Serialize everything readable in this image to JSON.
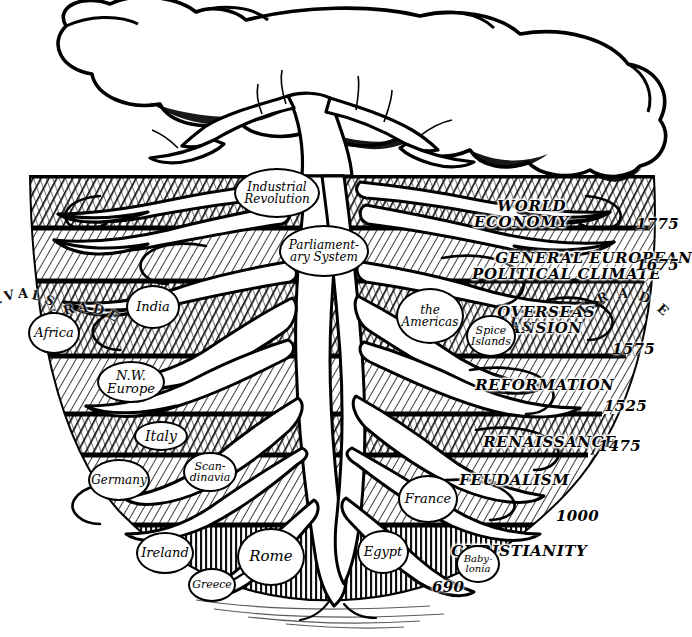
{
  "figure": {
    "medium": "pen-and-ink cross-hatched illustration",
    "caption_fragment": "",
    "ink_color": "#000000",
    "paper_color": "#ffffff"
  },
  "canopy": {
    "name": "tree-crown",
    "description": "outlined white lobed canopy with branching limbs"
  },
  "trunk": {
    "name": "tree-trunk",
    "description": "white trunk descending from canopy into soil strata"
  },
  "strata": [
    {
      "id": "world-economy",
      "label": "WORLD\nECONOMY",
      "label_plain": "WORLD ECONOMY",
      "end_date": "1775",
      "shade": "dark",
      "top": 176,
      "bottom": 228
    },
    {
      "id": "general-european-political-climate",
      "label": "GENERAL EUROPEAN\nPOLITICAL CLIMATE",
      "label_plain": "GENERAL EUROPEAN POLITICAL CLIMATE",
      "end_date": "1675",
      "shade": "light",
      "top": 228,
      "bottom": 281
    },
    {
      "id": "overseas-expansion",
      "label": "OVERSEAS\nEXPANSION",
      "label_plain": "OVERSEAS EXPANSION",
      "end_date": "1575",
      "shade": "dark",
      "top": 281,
      "bottom": 356
    },
    {
      "id": "reformation",
      "label": "REFORMATION",
      "label_plain": "REFORMATION",
      "end_date": "1525",
      "shade": "light",
      "top": 356,
      "bottom": 414
    },
    {
      "id": "renaissance",
      "label": "RENAISSANCE",
      "label_plain": "RENAISSANCE",
      "end_date": "1475",
      "shade": "dark",
      "top": 414,
      "bottom": 455
    },
    {
      "id": "feudalism",
      "label": "FEUDALISM",
      "label_plain": "FEUDALISM",
      "end_date": "1000",
      "shade": "light",
      "top": 455,
      "bottom": 525
    },
    {
      "id": "christianity",
      "label": "CHRISTIANITY",
      "label_plain": "CHRISTIANITY",
      "end_date": "690",
      "shade": "dark",
      "top": 525,
      "bottom": 600
    }
  ],
  "dates": [
    {
      "value": "1775",
      "x": 636,
      "y": 224
    },
    {
      "value": "1675",
      "x": 636,
      "y": 264
    },
    {
      "value": "1575",
      "x": 612,
      "y": 348
    },
    {
      "value": "1525",
      "x": 604,
      "y": 405
    },
    {
      "value": "1475",
      "x": 598,
      "y": 445
    },
    {
      "value": "1000",
      "x": 556,
      "y": 515
    },
    {
      "value": "690",
      "x": 432,
      "y": 586
    }
  ],
  "root_nodes": [
    {
      "id": "industrial-revolution",
      "label": "Industrial\nRevolution",
      "label_plain": "Industrial Revolution",
      "x": 234,
      "y": 168,
      "w": 86,
      "h": 50,
      "fs": 12
    },
    {
      "id": "parliamentary-system",
      "label": "Parliament-\nary System",
      "label_plain": "Parliamentary System",
      "x": 279,
      "y": 225,
      "w": 90,
      "h": 52,
      "fs": 12
    },
    {
      "id": "the-americas",
      "label": "the\nAmericas",
      "label_plain": "the Americas",
      "x": 396,
      "y": 288,
      "w": 68,
      "h": 56,
      "fs": 12
    },
    {
      "id": "spice-islands",
      "label": "Spice\nIslands",
      "label_plain": "Spice Islands",
      "x": 466,
      "y": 315,
      "w": 50,
      "h": 42,
      "fs": 11
    },
    {
      "id": "india",
      "label": "India",
      "label_plain": "India",
      "x": 126,
      "y": 285,
      "w": 54,
      "h": 44,
      "fs": 13
    },
    {
      "id": "africa",
      "label": "Africa",
      "label_plain": "Africa",
      "x": 28,
      "y": 312,
      "w": 52,
      "h": 42,
      "fs": 13
    },
    {
      "id": "nw-europe",
      "label": "N.W.\nEurope",
      "label_plain": "N.W. Europe",
      "x": 97,
      "y": 361,
      "w": 68,
      "h": 42,
      "fs": 13
    },
    {
      "id": "italy",
      "label": "Italy",
      "label_plain": "Italy",
      "x": 134,
      "y": 421,
      "w": 54,
      "h": 30,
      "fs": 14
    },
    {
      "id": "germany",
      "label": "Germany",
      "label_plain": "Germany",
      "x": 88,
      "y": 459,
      "w": 62,
      "h": 42,
      "fs": 12
    },
    {
      "id": "scandinavia",
      "label": "Scan-\ndinavia",
      "label_plain": "Scandinavia",
      "x": 183,
      "y": 452,
      "w": 54,
      "h": 40,
      "fs": 11
    },
    {
      "id": "france",
      "label": "France",
      "label_plain": "France",
      "x": 398,
      "y": 475,
      "w": 60,
      "h": 48,
      "fs": 13
    },
    {
      "id": "ireland",
      "label": "Ireland",
      "label_plain": "Ireland",
      "x": 136,
      "y": 532,
      "w": 58,
      "h": 42,
      "fs": 13
    },
    {
      "id": "greece",
      "label": "Greece",
      "label_plain": "Greece",
      "x": 188,
      "y": 568,
      "w": 48,
      "h": 34,
      "fs": 11
    },
    {
      "id": "rome",
      "label": "Rome",
      "label_plain": "Rome",
      "x": 237,
      "y": 528,
      "w": 68,
      "h": 58,
      "fs": 15
    },
    {
      "id": "egypt",
      "label": "Egypt",
      "label_plain": "Egypt",
      "x": 357,
      "y": 530,
      "w": 52,
      "h": 44,
      "fs": 13
    },
    {
      "id": "babylonia",
      "label": "Baby-\nlonia",
      "label_plain": "Babylonia",
      "x": 456,
      "y": 545,
      "w": 44,
      "h": 38,
      "fs": 10
    }
  ],
  "curved_words": [
    {
      "id": "slave-left",
      "text": "SLAVE",
      "x": 18,
      "y": 288,
      "arc": -55,
      "letters": [
        "S",
        "L",
        "A",
        "V",
        "E"
      ]
    },
    {
      "id": "trade-left",
      "text": "TRADE",
      "x": 78,
      "y": 300,
      "arc": 62,
      "letters": [
        "T",
        "R",
        "A",
        "D",
        "E"
      ]
    },
    {
      "id": "slave-right",
      "text": "SLAVE",
      "x": 498,
      "y": 316,
      "arc": -48,
      "letters": [
        "S",
        "L",
        "A",
        "V",
        "E"
      ]
    },
    {
      "id": "trade-right",
      "text": "TRADE",
      "x": 618,
      "y": 288,
      "arc": 86,
      "letters": [
        "T",
        "R",
        "A",
        "D",
        "E"
      ]
    }
  ]
}
